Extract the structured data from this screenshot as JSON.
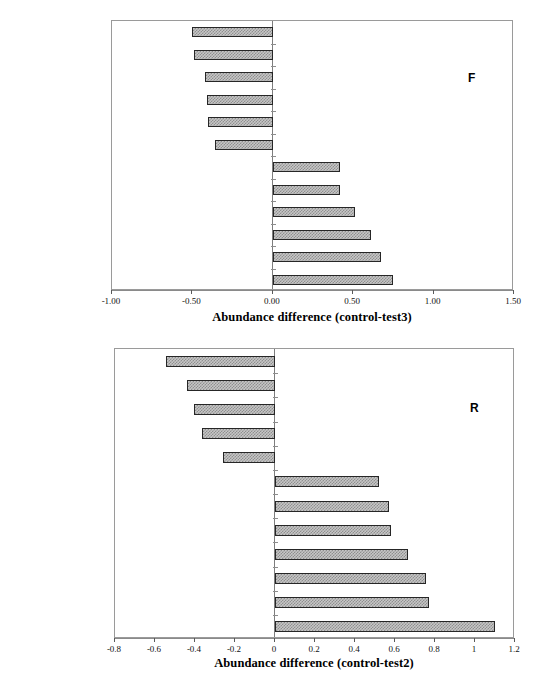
{
  "figure": {
    "top_faint_text": "",
    "background": "#ffffff"
  },
  "chart_data": [
    {
      "id": "panel-f",
      "type": "bar",
      "orientation": "horizontal",
      "panel_letter": "F",
      "title": "",
      "xlabel": "Abundance difference (control-test3)",
      "ylabel": "",
      "xlim": [
        -1.0,
        1.5
      ],
      "xticks": [
        -1.0,
        -0.5,
        0.0,
        0.5,
        1.0,
        1.5
      ],
      "xticklabels": [
        "-1.00",
        "-0.50",
        "0.00",
        "0.50",
        "1.00",
        "1.50"
      ],
      "grid": false,
      "legend": "none",
      "bar_fill": "#c6c6c6",
      "bar_edge": "#262626",
      "categories": [
        "Sphaeriidae",
        "Glossiphoniidae",
        "Limnephilidae",
        "Tubificidae",
        "Asellidae",
        "Tabanidae",
        "Polycentropodidae",
        "Caenidae",
        "Heptageniidae",
        "Leuctridae",
        "Rhyacophilidae",
        "Ephemerellidae"
      ],
      "values": [
        -0.5,
        -0.49,
        -0.42,
        -0.41,
        -0.4,
        -0.36,
        0.42,
        0.42,
        0.51,
        0.61,
        0.67,
        0.75
      ]
    },
    {
      "id": "panel-r",
      "type": "bar",
      "orientation": "horizontal",
      "panel_letter": "R",
      "title": "",
      "xlabel": "Abundance  difference (control-test2)",
      "ylabel": "",
      "xlim": [
        -0.8,
        1.2
      ],
      "xticks": [
        -0.8,
        -0.6,
        -0.4,
        -0.2,
        0,
        0.2,
        0.4,
        0.6,
        0.8,
        1,
        1.2
      ],
      "xticklabels": [
        "-0.8",
        "-0.6",
        "-0.4",
        "-0.2",
        "0",
        "0.2",
        "0.4",
        "0.6",
        "0.8",
        "1",
        "1.2"
      ],
      "grid": false,
      "legend": "none",
      "bar_fill": "#c6c6c6",
      "bar_edge": "#262626",
      "categories": [
        "Tabanidae",
        "Empididae",
        "Hydrophilidae",
        "Tanytarsini",
        "Nemouridae",
        "Leptoceridae",
        "Ephemeridae",
        "Polycentropodidae",
        "Gammaridae",
        "Leuctridae",
        "Rhyacophilidae",
        "Ephemerellidae"
      ],
      "values": [
        -0.545,
        -0.44,
        -0.405,
        -0.365,
        -0.26,
        0.52,
        0.57,
        0.58,
        0.665,
        0.755,
        0.77,
        1.1
      ]
    }
  ]
}
